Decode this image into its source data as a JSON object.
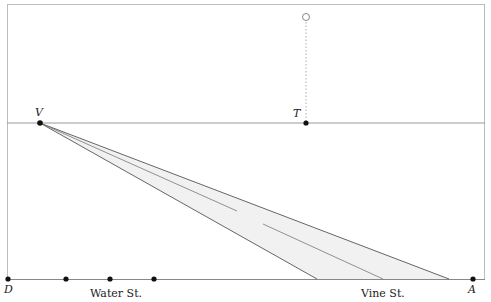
{
  "diagram": {
    "points": {
      "V": {
        "label": "V",
        "x": 40,
        "y": 123
      },
      "T": {
        "label": "T",
        "x": 306,
        "y": 123
      },
      "D": {
        "label": "D",
        "x": 8,
        "y": 279
      },
      "A": {
        "label": "A",
        "x": 473,
        "y": 279
      },
      "open_point": {
        "x": 306,
        "y": 17
      }
    },
    "street_labels": {
      "water": "Water St.",
      "vine": "Vine St."
    },
    "baseline_dots": [
      66,
      110,
      154
    ],
    "colors": {
      "frame": "#bdbdbd",
      "line": "#555555",
      "fill": "#f1f1f1",
      "dot": "#111111"
    }
  }
}
